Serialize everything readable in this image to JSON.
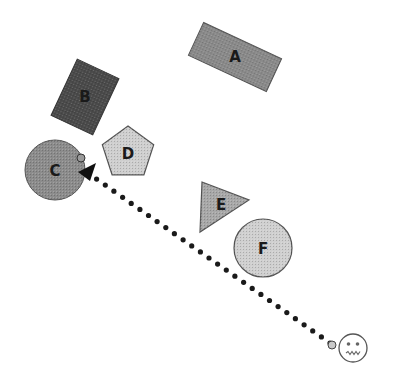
{
  "scene": {
    "width": 404,
    "height": 386,
    "background": "#ffffff"
  },
  "shapes": [
    {
      "id": "A",
      "label": "A",
      "type": "rectangle",
      "cx": 235,
      "cy": 57,
      "w": 86,
      "h": 36,
      "rotate": 25,
      "fill": "#8a8a8a"
    },
    {
      "id": "B",
      "label": "B",
      "type": "rectangle",
      "cx": 85,
      "cy": 97,
      "w": 46,
      "h": 62,
      "rotate": 25,
      "fill": "#4a4a4a"
    },
    {
      "id": "C",
      "label": "C",
      "type": "circle",
      "cx": 55,
      "cy": 170,
      "r": 30,
      "fill": "#8c8c8c"
    },
    {
      "id": "D",
      "label": "D",
      "type": "pentagon",
      "cx": 128,
      "cy": 153,
      "r": 27,
      "fill": "#cfcfcf"
    },
    {
      "id": "E",
      "label": "E",
      "type": "triangle",
      "points": "202,182 249,200 200,232",
      "fill": "#a8a8a8"
    },
    {
      "id": "F",
      "label": "F",
      "type": "circle",
      "cx": 263,
      "cy": 248,
      "r": 29,
      "fill": "#d0d0d0"
    }
  ],
  "path": {
    "x1": 88,
    "y1": 173,
    "x2": 330,
    "y2": 343,
    "dot_color": "#1a1a1a",
    "start_marker": {
      "cx": 81,
      "cy": 158,
      "r": 4
    },
    "end_marker": {
      "cx": 332,
      "cy": 345,
      "r": 4
    },
    "arrowhead": "78,172 96,163 90,181"
  },
  "agent": {
    "type": "face",
    "expression": "neutral-grimace",
    "cx": 353,
    "cy": 348,
    "r": 14
  }
}
